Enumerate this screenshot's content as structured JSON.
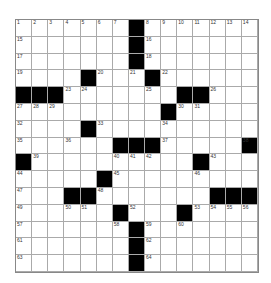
{
  "puzzle": {
    "rows": 15,
    "cols": 15,
    "grid": [
      "#######X#######",
      "#######X#######",
      "#######X#######",
      "####X###X######",
      "XXX#######XX###",
      "#########X#####",
      "####X##########",
      "######XXX#####X",
      "X##########X###",
      "#####X#########",
      "###XX#######XXX",
      "######X###X####",
      "#######X#######",
      "#######X#######",
      "#######X#######"
    ],
    "numbers": [
      {
        "r": 0,
        "c": 0,
        "n": "1"
      },
      {
        "r": 0,
        "c": 1,
        "n": "2"
      },
      {
        "r": 0,
        "c": 2,
        "n": "3"
      },
      {
        "r": 0,
        "c": 3,
        "n": "4"
      },
      {
        "r": 0,
        "c": 4,
        "n": "5"
      },
      {
        "r": 0,
        "c": 5,
        "n": "6"
      },
      {
        "r": 0,
        "c": 6,
        "n": "7"
      },
      {
        "r": 0,
        "c": 8,
        "n": "8"
      },
      {
        "r": 0,
        "c": 9,
        "n": "9"
      },
      {
        "r": 0,
        "c": 10,
        "n": "10"
      },
      {
        "r": 0,
        "c": 11,
        "n": "11"
      },
      {
        "r": 0,
        "c": 12,
        "n": "12"
      },
      {
        "r": 0,
        "c": 13,
        "n": "13"
      },
      {
        "r": 0,
        "c": 14,
        "n": "14"
      },
      {
        "r": 1,
        "c": 0,
        "n": "15"
      },
      {
        "r": 1,
        "c": 8,
        "n": "16"
      },
      {
        "r": 2,
        "c": 0,
        "n": "17"
      },
      {
        "r": 2,
        "c": 8,
        "n": "18"
      },
      {
        "r": 3,
        "c": 0,
        "n": "19"
      },
      {
        "r": 3,
        "c": 5,
        "n": "20"
      },
      {
        "r": 3,
        "c": 7,
        "n": "21"
      },
      {
        "r": 3,
        "c": 9,
        "n": "22"
      },
      {
        "r": 4,
        "c": 3,
        "n": "23"
      },
      {
        "r": 4,
        "c": 4,
        "n": "24"
      },
      {
        "r": 4,
        "c": 8,
        "n": "25"
      },
      {
        "r": 4,
        "c": 12,
        "n": "26"
      },
      {
        "r": 5,
        "c": 0,
        "n": "27"
      },
      {
        "r": 5,
        "c": 1,
        "n": "28"
      },
      {
        "r": 5,
        "c": 2,
        "n": "29"
      },
      {
        "r": 5,
        "c": 10,
        "n": "30"
      },
      {
        "r": 5,
        "c": 11,
        "n": "31"
      },
      {
        "r": 6,
        "c": 0,
        "n": "32"
      },
      {
        "r": 6,
        "c": 5,
        "n": "33"
      },
      {
        "r": 6,
        "c": 9,
        "n": "34"
      },
      {
        "r": 7,
        "c": 0,
        "n": "35"
      },
      {
        "r": 7,
        "c": 3,
        "n": "36"
      },
      {
        "r": 7,
        "c": 9,
        "n": "37"
      },
      {
        "r": 7,
        "c": 14,
        "n": "38"
      },
      {
        "r": 8,
        "c": 1,
        "n": "39"
      },
      {
        "r": 8,
        "c": 6,
        "n": "40"
      },
      {
        "r": 8,
        "c": 7,
        "n": "41"
      },
      {
        "r": 8,
        "c": 8,
        "n": "42"
      },
      {
        "r": 8,
        "c": 12,
        "n": "43"
      },
      {
        "r": 9,
        "c": 0,
        "n": "44"
      },
      {
        "r": 9,
        "c": 6,
        "n": "45"
      },
      {
        "r": 9,
        "c": 11,
        "n": "46"
      },
      {
        "r": 10,
        "c": 0,
        "n": "47"
      },
      {
        "r": 10,
        "c": 5,
        "n": "48"
      },
      {
        "r": 11,
        "c": 0,
        "n": "49"
      },
      {
        "r": 11,
        "c": 3,
        "n": "50"
      },
      {
        "r": 11,
        "c": 4,
        "n": "51"
      },
      {
        "r": 11,
        "c": 7,
        "n": "52"
      },
      {
        "r": 11,
        "c": 11,
        "n": "53"
      },
      {
        "r": 11,
        "c": 12,
        "n": "54"
      },
      {
        "r": 11,
        "c": 13,
        "n": "55"
      },
      {
        "r": 11,
        "c": 14,
        "n": "56"
      },
      {
        "r": 12,
        "c": 0,
        "n": "57"
      },
      {
        "r": 12,
        "c": 6,
        "n": "58"
      },
      {
        "r": 12,
        "c": 8,
        "n": "59"
      },
      {
        "r": 12,
        "c": 10,
        "n": "60"
      },
      {
        "r": 13,
        "c": 0,
        "n": "61"
      },
      {
        "r": 13,
        "c": 8,
        "n": "62"
      },
      {
        "r": 14,
        "c": 0,
        "n": "63"
      },
      {
        "r": 14,
        "c": 8,
        "n": "64"
      }
    ]
  }
}
